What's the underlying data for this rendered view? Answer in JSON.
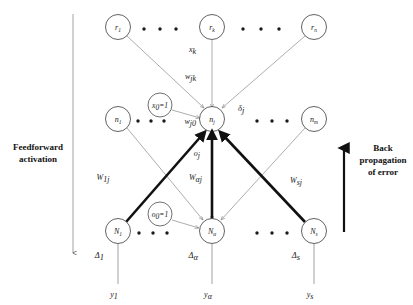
{
  "diagram": {
    "layers": {
      "input": {
        "name": "input-layer",
        "nodes": [
          {
            "id": "r1",
            "base": "r",
            "sub": "1"
          },
          {
            "id": "rk",
            "base": "r",
            "sub": "k"
          },
          {
            "id": "rn",
            "base": "r",
            "sub": "n"
          }
        ]
      },
      "hidden": {
        "name": "hidden-layer",
        "nodes": [
          {
            "id": "n1",
            "base": "n",
            "sub": "1"
          },
          {
            "id": "nj",
            "base": "n",
            "sub": "j"
          },
          {
            "id": "nm",
            "base": "n",
            "sub": "m"
          }
        ],
        "bias": {
          "id": "x0",
          "label": "x",
          "sub": "0",
          "value": "=1",
          "full": "x0=1"
        }
      },
      "output": {
        "name": "output-layer",
        "nodes": [
          {
            "id": "N1",
            "base": "N",
            "sub": "1"
          },
          {
            "id": "Na",
            "base": "N",
            "sub": "α"
          },
          {
            "id": "Ns",
            "base": "N",
            "sub": "s"
          }
        ],
        "bias": {
          "id": "o0",
          "label": "o",
          "sub": "0",
          "value": "=1",
          "full": "o0=1"
        }
      }
    },
    "edge_labels": {
      "input_signal": {
        "base": "x",
        "sub": "k"
      },
      "hidden_weight": {
        "base": "w",
        "sub": "jk"
      },
      "hidden_bias_weight": {
        "base": "w",
        "sub": "j0"
      },
      "hidden_output": {
        "base": "o",
        "sub": "j"
      },
      "output_weight_first": {
        "base": "W",
        "sub": "1j"
      },
      "output_weight_alpha": {
        "base": "W",
        "sub": "αj"
      },
      "output_weight_last": {
        "base": "W",
        "sub": "sj"
      },
      "hidden_delta": {
        "base": "δ",
        "sub": "j"
      }
    },
    "output_deltas": [
      {
        "base": "Δ",
        "sub": "1"
      },
      {
        "base": "Δ",
        "sub": "α"
      },
      {
        "base": "Δ",
        "sub": "s"
      }
    ],
    "outputs": [
      {
        "base": "y",
        "sub": "1"
      },
      {
        "base": "y",
        "sub": "α"
      },
      {
        "base": "y",
        "sub": "s"
      }
    ],
    "annotations": {
      "left": {
        "name": "feedforward-annotation",
        "line1": "Feedforward",
        "line2": "activation",
        "direction": "down"
      },
      "right": {
        "name": "backpropagation-annotation",
        "line1": "Back",
        "line2": "propagation",
        "line3": "of error",
        "direction": "up"
      }
    },
    "ellipsis": {
      "glyph": "•",
      "count_per_gap": 3
    },
    "colors": {
      "background": "#ffffff",
      "node_stroke": "#3a3a3a",
      "thin_edge": "#8a8a8a",
      "thick_edge": "#111111",
      "text": "#1a1a1a"
    }
  }
}
